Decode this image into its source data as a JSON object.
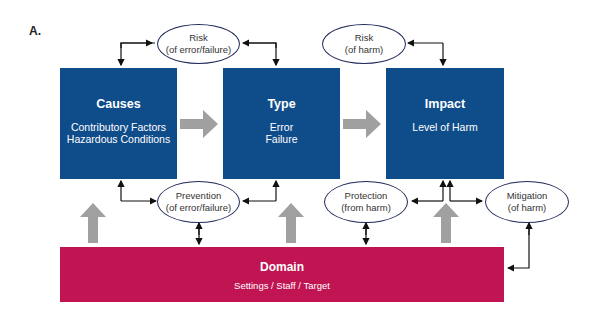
{
  "panel_label": "A.",
  "boxes": {
    "causes": {
      "title": "Causes",
      "line1": "Contributory Factors",
      "line2": "Hazardous Conditions"
    },
    "type": {
      "title": "Type",
      "line1": "Error",
      "line2": "Failure"
    },
    "impact": {
      "title": "Impact",
      "line1": "Level of Harm"
    }
  },
  "domain": {
    "title": "Domain",
    "subtitle": "Settings / Staff / Target"
  },
  "ovals": {
    "risk_error": {
      "line1": "Risk",
      "line2": "(of error/failure)"
    },
    "risk_harm": {
      "line1": "Risk",
      "line2": "(of harm)"
    },
    "prevention": {
      "line1": "Prevention",
      "line2": "(of error/failure)"
    },
    "protection": {
      "line1": "Protection",
      "line2": "(from harm)"
    },
    "mitigation": {
      "line1": "Mitigation",
      "line2": "(of harm)"
    }
  },
  "colors": {
    "box_blue": "#0f4c8a",
    "domain_red": "#c01552",
    "arrow_gray": "#a0a0a0",
    "connector": "#111111"
  }
}
